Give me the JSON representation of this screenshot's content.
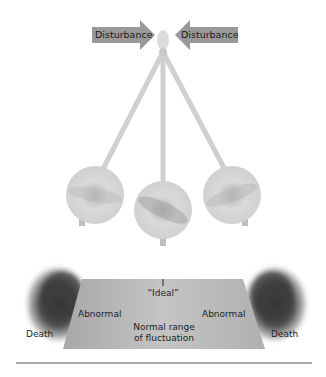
{
  "figure": {
    "disturbance_arrows": [
      {
        "label": "Disturbance",
        "direction": "right"
      },
      {
        "label": "Disturbance",
        "direction": "left"
      }
    ],
    "pendulum": {
      "positions": [
        "left",
        "center",
        "right"
      ]
    },
    "range_diagram": {
      "ideal_label": "“Ideal”",
      "left_abnormal": "Abnormal",
      "right_abnormal": "Abnormal",
      "normal_range_line1": "Normal range",
      "normal_range_line2": "of fluctuation",
      "left_death": "Death",
      "right_death": "Death"
    },
    "colors": {
      "arrow_fill": "#9a9a9a",
      "trapezoid_fill": "#b9b9b9",
      "death_blob": "#3c3c3c",
      "bob": "#c8c8c8",
      "rule": "#555555"
    }
  }
}
